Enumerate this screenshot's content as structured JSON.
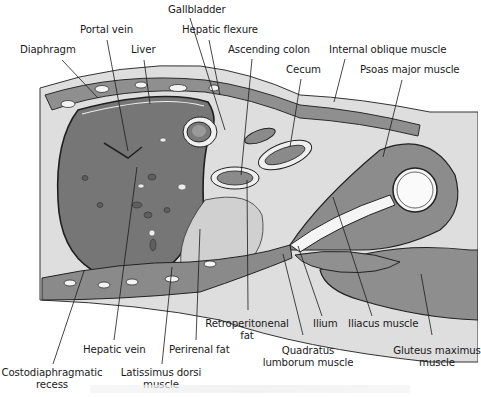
{
  "figure": {
    "type": "anatomical cross-section illustration",
    "colors": {
      "background": "#ffffff",
      "skin_fat": "#d9d9d9",
      "muscle": "#8c8c8c",
      "liver": "#7a7a7a",
      "organ_light": "#c8c8c8",
      "outline": "#2a2a2a",
      "bone": "#f2f2f2",
      "label_text": "#1a1a1a"
    }
  },
  "labels": [
    {
      "id": "gallbladder",
      "text": "Gallbladder",
      "x": 168,
      "y": 4,
      "line": [
        [
          190,
          18
        ],
        [
          225,
          130
        ]
      ]
    },
    {
      "id": "portal-vein",
      "text": "Portal vein",
      "x": 80,
      "y": 24,
      "line": [
        [
          107,
          40
        ],
        [
          128,
          151
        ]
      ]
    },
    {
      "id": "hepatic-flexure",
      "text": "Hepatic flexure",
      "x": 182,
      "y": 24,
      "line": [
        [
          209,
          40
        ],
        [
          220,
          95
        ]
      ]
    },
    {
      "id": "diaphragm",
      "text": "Diaphragm",
      "x": 20,
      "y": 44,
      "line": [
        [
          62,
          60
        ],
        [
          98,
          98
        ]
      ]
    },
    {
      "id": "liver",
      "text": "Liver",
      "x": 131,
      "y": 44,
      "line": [
        [
          144,
          60
        ],
        [
          150,
          104
        ]
      ]
    },
    {
      "id": "ascending-colon",
      "text": "Ascending colon",
      "x": 228,
      "y": 44,
      "line": [
        [
          252,
          59
        ],
        [
          241,
          175
        ]
      ]
    },
    {
      "id": "internal-oblique-muscle",
      "text": "Internal oblique muscle",
      "x": 329,
      "y": 44,
      "line": [
        [
          345,
          59
        ],
        [
          334,
          102
        ]
      ]
    },
    {
      "id": "cecum",
      "text": "Cecum",
      "x": 286,
      "y": 64,
      "line": [
        [
          301,
          79
        ],
        [
          290,
          147
        ]
      ]
    },
    {
      "id": "psoas-major-muscle",
      "text": "Psoas major muscle",
      "x": 360,
      "y": 64,
      "line": [
        [
          402,
          80
        ],
        [
          383,
          157
        ]
      ]
    },
    {
      "id": "retroperitonenal-fat",
      "text": "Retroperitonenal",
      "text2": "fat",
      "x": 247,
      "y": 318,
      "line": [
        [
          248,
          310
        ],
        [
          247,
          180
        ]
      ]
    },
    {
      "id": "ilium",
      "text": "Ilium",
      "x": 313,
      "y": 318,
      "line": [
        [
          322,
          316
        ],
        [
          298,
          246
        ]
      ]
    },
    {
      "id": "iliacus-muscle",
      "text": "Iliacus muscle",
      "x": 348,
      "y": 318,
      "line": [
        [
          372,
          316
        ],
        [
          333,
          197
        ]
      ]
    },
    {
      "id": "hepatic-vein",
      "text": "Hepatic vein",
      "x": 83,
      "y": 344,
      "line": [
        [
          114,
          340
        ],
        [
          137,
          167
        ]
      ]
    },
    {
      "id": "perirenal-fat",
      "text": "Perirenal fat",
      "x": 169,
      "y": 344,
      "line": [
        [
          196,
          340
        ],
        [
          200,
          229
        ]
      ]
    },
    {
      "id": "quadratus-lumborum-muscle",
      "text": "Quadratus",
      "text2": "lumborum muscle",
      "x": 308,
      "y": 345,
      "line": [
        [
          303,
          335
        ],
        [
          283,
          254
        ]
      ]
    },
    {
      "id": "gluteus-maximus-muscle",
      "text": "Gluteus maximus",
      "text2": "muscle",
      "x": 437,
      "y": 345,
      "line": [
        [
          432,
          335
        ],
        [
          421,
          274
        ]
      ]
    },
    {
      "id": "costodiaphragmatic-recess",
      "text": "Costodiaphragmatic",
      "text2": "recess",
      "x": 52,
      "y": 367,
      "line": [
        [
          53,
          364
        ],
        [
          84,
          271
        ]
      ]
    },
    {
      "id": "latissimus-dorsi-muscle",
      "text": "Latissimus dorsi",
      "text2": "muscle",
      "x": 161,
      "y": 367,
      "line": [
        [
          162,
          364
        ],
        [
          172,
          267
        ]
      ]
    }
  ]
}
